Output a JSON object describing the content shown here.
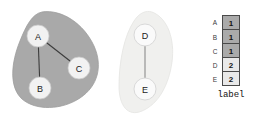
{
  "figure": {
    "background": "#ffffff"
  },
  "clusters": [
    {
      "id": "cluster-1",
      "name": "dark-cluster",
      "fill": "#a9a9a9",
      "stroke": "#9a9a9a",
      "label_value": "1",
      "members": [
        "A",
        "B",
        "C"
      ]
    },
    {
      "id": "cluster-2",
      "name": "light-cluster",
      "fill": "#f0f0ee",
      "stroke": "#e6e6e4",
      "label_value": "2",
      "members": [
        "D",
        "E"
      ]
    }
  ],
  "nodes": [
    {
      "id": "A",
      "label": "A",
      "cx": 38,
      "cy": 36,
      "r": 11,
      "fill": "#f2f2f2",
      "stroke": "#c9c9c9"
    },
    {
      "id": "B",
      "label": "B",
      "cx": 40,
      "cy": 88,
      "r": 11,
      "fill": "#f2f2f2",
      "stroke": "#c9c9c9"
    },
    {
      "id": "C",
      "label": "C",
      "cx": 79,
      "cy": 68,
      "r": 11,
      "fill": "#f2f2f2",
      "stroke": "#c9c9c9"
    },
    {
      "id": "D",
      "label": "D",
      "cx": 145,
      "cy": 35,
      "r": 11,
      "fill": "#fafafa",
      "stroke": "#d5d5d5"
    },
    {
      "id": "E",
      "label": "E",
      "cx": 145,
      "cy": 89,
      "r": 11,
      "fill": "#fafafa",
      "stroke": "#d5d5d5"
    }
  ],
  "edges": [
    {
      "id": "edge-A-B",
      "source": "A",
      "target": "B",
      "stroke": "#3c3c3c",
      "width": 1.1
    },
    {
      "id": "edge-A-C",
      "source": "A",
      "target": "C",
      "stroke": "#3c3c3c",
      "width": 1.1
    },
    {
      "id": "edge-D-E",
      "source": "D",
      "target": "E",
      "stroke": "#8c8c8c",
      "width": 1.1
    }
  ],
  "table": {
    "caption": "label",
    "colors": {
      "fill_1": "#aaaaaa",
      "fill_2": "#e9e9e9",
      "border": "#4a4a4a"
    },
    "rows": [
      {
        "label": "A",
        "value": "1"
      },
      {
        "label": "B",
        "value": "1"
      },
      {
        "label": "C",
        "value": "1"
      },
      {
        "label": "D",
        "value": "2"
      },
      {
        "label": "E",
        "value": "2"
      }
    ]
  }
}
